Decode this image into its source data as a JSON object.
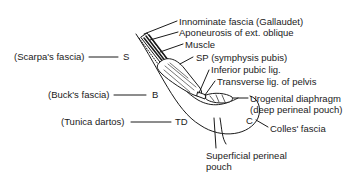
{
  "diagram": {
    "type": "anatomical-cross-section",
    "colors": {
      "ink": "#1a1a1a",
      "background": "#ffffff"
    },
    "left_labels": [
      {
        "id": "scarpa",
        "text": "(Scarpa's fascia)",
        "abbr": "S"
      },
      {
        "id": "buck",
        "text": "(Buck's fascia)",
        "abbr": "B"
      },
      {
        "id": "tunica",
        "text": "(Tunica dartos)",
        "abbr": "TD"
      }
    ],
    "right_labels": [
      {
        "id": "innominate",
        "text": "Innominate fascia (Gallaudet)"
      },
      {
        "id": "aponeurosis",
        "text": "Aponeurosis of ext. oblique"
      },
      {
        "id": "muscle",
        "text": "Muscle"
      },
      {
        "id": "sp",
        "text": "SP (symphysis pubis)"
      },
      {
        "id": "inferior-pubic",
        "text": "Inferior pubic lig."
      },
      {
        "id": "transverse",
        "text": "Transverse lig. of pelvis"
      },
      {
        "id": "urogenital-1",
        "text": "Urogenital diaphragm"
      },
      {
        "id": "urogenital-2",
        "text": "(deep perineal pouch)"
      },
      {
        "id": "colles-abbr",
        "text": "C"
      },
      {
        "id": "colles",
        "text": "Colles' fascia"
      },
      {
        "id": "superficial-1",
        "text": "Superficial perineal"
      },
      {
        "id": "superficial-2",
        "text": "pouch"
      }
    ]
  }
}
